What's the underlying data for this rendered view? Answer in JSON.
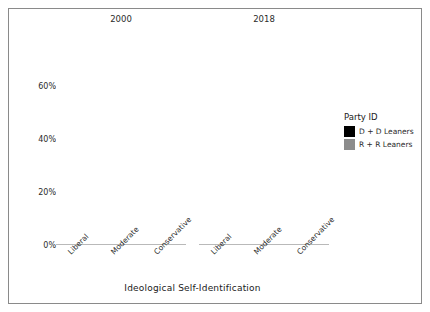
{
  "chart_data": {
    "type": "bar",
    "title": "",
    "subtitle": "",
    "xlabel": "Ideological Self-Identification",
    "ylabel": "Percent",
    "categories": [
      "Liberal",
      "Moderate",
      "Conservative"
    ],
    "panels": [
      {
        "label": "2000",
        "series": [
          {
            "name": "D + D Leaners",
            "values": [
              37,
              41,
              20
            ]
          },
          {
            "name": "R + R Leaners",
            "values": [
              11,
              34,
              54
            ]
          }
        ]
      },
      {
        "label": "2018",
        "series": [
          {
            "name": "D + D Leaners",
            "values": [
              54,
              37,
              8
            ]
          },
          {
            "name": "R + R Leaners",
            "values": [
              1.5,
              24,
              72
            ]
          }
        ]
      }
    ],
    "ylim": [
      0,
      76
    ],
    "yticks": [
      0,
      20,
      40,
      60
    ],
    "ytick_labels": [
      "0%",
      "20%",
      "40%",
      "60%"
    ],
    "grid": false,
    "legend_position": "right",
    "legend_title": "Party ID",
    "colors": {
      "dem": "#000000",
      "rep": "#8c8c8c",
      "axis": "#b9b9b9",
      "border": "#8a8a8a",
      "text": "#1a1a1a"
    }
  },
  "axes": {
    "y_title": "Percent",
    "x_title": "Ideological Self-Identification",
    "y_ticks": [
      "0%",
      "20%",
      "40%",
      "60%"
    ]
  },
  "panels": {
    "first_title": "2000",
    "second_title": "2018"
  },
  "categories": {
    "c0": "Liberal",
    "c1": "Moderate",
    "c2": "Conservative"
  },
  "legend": {
    "title": "Party ID",
    "dem_label": "D + D Leaners",
    "rep_label": "R + R Leaners"
  }
}
